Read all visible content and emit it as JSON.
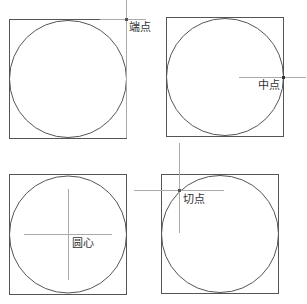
{
  "panels": [
    {
      "id": "endpoint",
      "label": "端点"
    },
    {
      "id": "midpoint",
      "label": "中点"
    },
    {
      "id": "center",
      "label": "圆心"
    },
    {
      "id": "tangent",
      "label": "切点"
    }
  ],
  "colors": {
    "shape": "#555555",
    "crosshair": "#aaaaaa",
    "label": "#333333"
  }
}
